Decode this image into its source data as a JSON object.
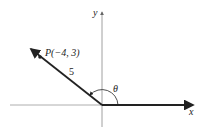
{
  "diagram": {
    "type": "angle-in-standard-position",
    "axes": {
      "x_label": "x",
      "y_label": "y"
    },
    "point": {
      "label": "P(−4, 3)",
      "name": "P",
      "x": -4,
      "y": 3
    },
    "radius_label": "5",
    "angle_label": "θ",
    "colors": {
      "ray": "#222222",
      "axis": "#888888",
      "text": "#222222"
    }
  }
}
